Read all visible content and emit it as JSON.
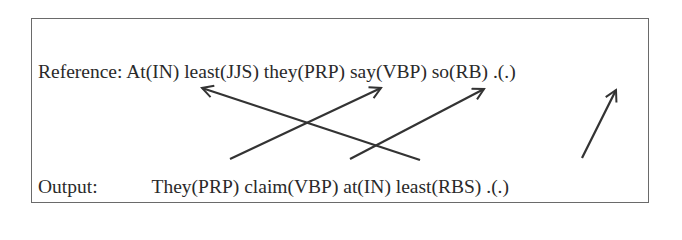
{
  "figure": {
    "reference": {
      "label": "Reference:",
      "tokens": [
        {
          "word": "At",
          "tag": "IN",
          "text": "At(IN)"
        },
        {
          "word": "least",
          "tag": "JJS",
          "text": "least(JJS)"
        },
        {
          "word": "they",
          "tag": "PRP",
          "text": "they(PRP)"
        },
        {
          "word": "say",
          "tag": "VBP",
          "text": "say(VBP)"
        },
        {
          "word": "so",
          "tag": "RB",
          "text": "so(RB)"
        },
        {
          "word": ".",
          "tag": ".",
          "text": ".(.)"
        }
      ]
    },
    "output": {
      "label": "Output:",
      "tokens": [
        {
          "word": "They",
          "tag": "PRP",
          "text": "They(PRP)"
        },
        {
          "word": "claim",
          "tag": "VBP",
          "text": "claim(VBP)"
        },
        {
          "word": "at",
          "tag": "IN",
          "text": "at(IN)"
        },
        {
          "word": "least",
          "tag": "RBS",
          "text": "least(RBS)"
        },
        {
          "word": ".",
          "tag": ".",
          "text": ".(.)"
        }
      ]
    },
    "alignments": [
      {
        "from_output": "at(IN)",
        "to_reference": "At(IN)"
      },
      {
        "from_output": "They(PRP)",
        "to_reference": "they(PRP)"
      },
      {
        "from_output": "claim(VBP)",
        "to_reference": "say(VBP)"
      },
      {
        "from_output": ".(.)",
        "to_reference": ".(.)"
      }
    ],
    "colors": {
      "text": "#2a2a2a",
      "arrow": "#333333",
      "border": "#6a6a6a"
    }
  }
}
